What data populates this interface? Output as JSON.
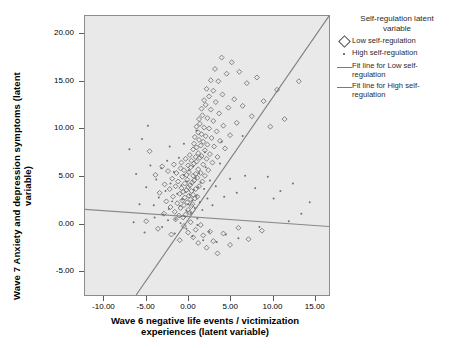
{
  "axes": {
    "y_title": "Wave 7 Anxiety and depression symptoms (latent\nvariable)",
    "x_title": "Wave 6 negative life events / victimization\nexperiences (latent variable)",
    "y_ticks": [
      "20.00",
      "15.00",
      "10.00",
      "5.00",
      "0.00",
      "-5.00"
    ],
    "x_ticks": [
      "-10.00",
      "-5.00",
      "0.00",
      "5.00",
      "10.00",
      "15.00"
    ]
  },
  "legend": {
    "title": "Self-regulation latent\nvariable",
    "items": [
      {
        "key": "diamond",
        "label": "Low self-regulation"
      },
      {
        "key": "dot",
        "label": "High self-regulation"
      },
      {
        "key": "line",
        "label": "Fit line for Low self-\nregulation"
      },
      {
        "key": "line",
        "label": "Fit line for High self-\nregulation"
      }
    ]
  },
  "colors": {
    "plot_background": "#e9e9e9",
    "frame": "#8c8c8c",
    "marker": "#6f6f6f",
    "fit_line_low": "#7c7c7c",
    "fit_line_high": "#8a8a8a",
    "text": "#000000"
  },
  "chart_data": {
    "type": "scatter",
    "title": "",
    "xlabel": "Wave 6 negative life events / victimization experiences (latent variable)",
    "ylabel": "Wave 7 Anxiety and depression symptoms (latent variable)",
    "xlim": [
      -12.3,
      16.8
    ],
    "ylim": [
      -7.6,
      21.9
    ],
    "grid": false,
    "legend_position": "right",
    "series": [
      {
        "name": "Low self-regulation",
        "marker": "open-diamond",
        "points": [
          [
            -4.6,
            7.6
          ],
          [
            -3.9,
            5.1
          ],
          [
            -3.4,
            3.2
          ],
          [
            -3.1,
            6.0
          ],
          [
            -2.8,
            4.1
          ],
          [
            -2.6,
            2.3
          ],
          [
            -2.4,
            5.5
          ],
          [
            -2.2,
            3.6
          ],
          [
            -2.1,
            1.7
          ],
          [
            -1.9,
            4.7
          ],
          [
            -1.8,
            2.8
          ],
          [
            -1.7,
            6.2
          ],
          [
            -1.6,
            1.2
          ],
          [
            -1.5,
            3.9
          ],
          [
            -1.4,
            5.3
          ],
          [
            -1.3,
            2.1
          ],
          [
            -1.2,
            4.4
          ],
          [
            -1.1,
            0.8
          ],
          [
            -1.0,
            3.1
          ],
          [
            -0.9,
            5.8
          ],
          [
            -0.9,
            1.6
          ],
          [
            -0.8,
            3.7
          ],
          [
            -0.8,
            6.4
          ],
          [
            -0.7,
            2.4
          ],
          [
            -0.7,
            4.9
          ],
          [
            -0.6,
            0.6
          ],
          [
            -0.6,
            3.3
          ],
          [
            -0.5,
            5.6
          ],
          [
            -0.5,
            1.9
          ],
          [
            -0.4,
            4.2
          ],
          [
            -0.4,
            2.7
          ],
          [
            -0.3,
            6.8
          ],
          [
            -0.3,
            0.9
          ],
          [
            -0.2,
            3.5
          ],
          [
            -0.2,
            5.1
          ],
          [
            -0.1,
            2.2
          ],
          [
            -0.1,
            4.6
          ],
          [
            0.0,
            1.4
          ],
          [
            0.0,
            3.8
          ],
          [
            0.0,
            6.1
          ],
          [
            0.1,
            2.9
          ],
          [
            0.1,
            5.4
          ],
          [
            0.2,
            1.1
          ],
          [
            0.2,
            4.0
          ],
          [
            0.2,
            7.2
          ],
          [
            0.3,
            2.5
          ],
          [
            0.3,
            5.9
          ],
          [
            0.4,
            3.4
          ],
          [
            0.4,
            1.8
          ],
          [
            0.4,
            6.6
          ],
          [
            0.5,
            4.3
          ],
          [
            0.5,
            2.0
          ],
          [
            0.6,
            7.8
          ],
          [
            0.6,
            5.0
          ],
          [
            0.6,
            3.0
          ],
          [
            0.7,
            8.4
          ],
          [
            0.7,
            6.3
          ],
          [
            0.7,
            4.5
          ],
          [
            0.8,
            2.6
          ],
          [
            0.8,
            9.1
          ],
          [
            0.9,
            7.0
          ],
          [
            0.9,
            5.2
          ],
          [
            0.9,
            3.6
          ],
          [
            1.0,
            10.2
          ],
          [
            1.0,
            8.0
          ],
          [
            1.0,
            6.5
          ],
          [
            1.1,
            4.8
          ],
          [
            1.1,
            2.8
          ],
          [
            1.2,
            9.6
          ],
          [
            1.2,
            7.4
          ],
          [
            1.2,
            5.7
          ],
          [
            1.3,
            11.0
          ],
          [
            1.3,
            8.8
          ],
          [
            1.3,
            3.9
          ],
          [
            1.4,
            6.9
          ],
          [
            1.4,
            10.5
          ],
          [
            1.5,
            8.2
          ],
          [
            1.5,
            5.3
          ],
          [
            1.6,
            12.1
          ],
          [
            1.6,
            9.4
          ],
          [
            1.6,
            7.1
          ],
          [
            1.7,
            4.4
          ],
          [
            1.7,
            11.4
          ],
          [
            1.8,
            8.6
          ],
          [
            1.8,
            6.2
          ],
          [
            1.9,
            13.0
          ],
          [
            1.9,
            10.1
          ],
          [
            2.0,
            7.7
          ],
          [
            2.0,
            5.0
          ],
          [
            2.1,
            12.5
          ],
          [
            2.1,
            9.2
          ],
          [
            2.2,
            6.8
          ],
          [
            2.2,
            14.2
          ],
          [
            2.3,
            11.1
          ],
          [
            2.3,
            8.3
          ],
          [
            2.4,
            5.6
          ],
          [
            2.5,
            13.4
          ],
          [
            2.5,
            10.0
          ],
          [
            2.6,
            7.3
          ],
          [
            2.7,
            15.1
          ],
          [
            2.7,
            12.0
          ],
          [
            2.8,
            9.0
          ],
          [
            2.9,
            6.4
          ],
          [
            3.0,
            14.0
          ],
          [
            3.0,
            10.8
          ],
          [
            3.1,
            8.1
          ],
          [
            3.2,
            16.3
          ],
          [
            3.3,
            12.8
          ],
          [
            3.4,
            9.7
          ],
          [
            3.5,
            7.0
          ],
          [
            3.6,
            15.0
          ],
          [
            3.7,
            11.6
          ],
          [
            3.8,
            8.7
          ],
          [
            4.0,
            17.5
          ],
          [
            4.1,
            13.6
          ],
          [
            4.2,
            10.3
          ],
          [
            4.4,
            7.9
          ],
          [
            4.6,
            15.8
          ],
          [
            4.8,
            12.2
          ],
          [
            5.0,
            9.3
          ],
          [
            5.2,
            17.0
          ],
          [
            5.5,
            13.1
          ],
          [
            5.8,
            10.6
          ],
          [
            6.1,
            16.0
          ],
          [
            6.5,
            12.4
          ],
          [
            7.0,
            14.8
          ],
          [
            7.6,
            11.3
          ],
          [
            8.2,
            15.4
          ],
          [
            9.0,
            12.9
          ],
          [
            9.8,
            10.2
          ],
          [
            10.6,
            14.1
          ],
          [
            11.5,
            11.0
          ],
          [
            13.2,
            15.0
          ],
          [
            -5.0,
            0.2
          ],
          [
            -3.6,
            -0.6
          ],
          [
            -2.9,
            1.0
          ],
          [
            -2.0,
            -1.2
          ],
          [
            -1.5,
            0.4
          ],
          [
            -1.0,
            -1.8
          ],
          [
            -0.5,
            -0.3
          ],
          [
            0.0,
            -1.0
          ],
          [
            0.3,
            0.1
          ],
          [
            0.6,
            -1.5
          ],
          [
            0.9,
            -0.7
          ],
          [
            1.2,
            -2.1
          ],
          [
            1.5,
            -0.2
          ],
          [
            1.8,
            -1.3
          ],
          [
            2.2,
            -2.6
          ],
          [
            2.6,
            -0.9
          ],
          [
            3.0,
            -1.9
          ],
          [
            3.5,
            -3.2
          ],
          [
            4.2,
            -1.1
          ],
          [
            5.0,
            -2.3
          ],
          [
            6.0,
            -0.5
          ],
          [
            7.2,
            -1.7
          ],
          [
            8.8,
            -0.8
          ]
        ]
      },
      {
        "name": "High self-regulation",
        "marker": "small-dot",
        "points": [
          [
            -7.0,
            7.8
          ],
          [
            -6.2,
            5.2
          ],
          [
            -5.5,
            8.9
          ],
          [
            -5.0,
            3.8
          ],
          [
            -4.5,
            6.1
          ],
          [
            -4.1,
            1.9
          ],
          [
            -3.8,
            4.6
          ],
          [
            -3.5,
            2.7
          ],
          [
            -3.2,
            5.8
          ],
          [
            -3.0,
            0.9
          ],
          [
            -2.7,
            3.4
          ],
          [
            -2.5,
            6.6
          ],
          [
            -2.3,
            1.5
          ],
          [
            -2.1,
            4.2
          ],
          [
            -1.9,
            2.3
          ],
          [
            -1.7,
            5.4
          ],
          [
            -1.5,
            0.4
          ],
          [
            -1.3,
            3.1
          ],
          [
            -1.1,
            6.9
          ],
          [
            -1.0,
            1.8
          ],
          [
            -0.8,
            4.0
          ],
          [
            -0.7,
            2.5
          ],
          [
            -0.5,
            5.1
          ],
          [
            -0.4,
            0.7
          ],
          [
            -0.3,
            3.3
          ],
          [
            -0.2,
            1.3
          ],
          [
            -0.1,
            4.4
          ],
          [
            0.0,
            2.0
          ],
          [
            0.1,
            5.6
          ],
          [
            0.2,
            3.0
          ],
          [
            0.3,
            1.1
          ],
          [
            0.4,
            4.1
          ],
          [
            0.5,
            2.4
          ],
          [
            0.6,
            6.0
          ],
          [
            0.7,
            3.5
          ],
          [
            0.8,
            1.6
          ],
          [
            0.9,
            4.8
          ],
          [
            1.0,
            2.9
          ],
          [
            1.1,
            0.5
          ],
          [
            1.2,
            3.8
          ],
          [
            1.3,
            5.3
          ],
          [
            1.4,
            2.2
          ],
          [
            1.5,
            4.3
          ],
          [
            1.7,
            1.4
          ],
          [
            1.9,
            3.6
          ],
          [
            2.1,
            5.9
          ],
          [
            2.3,
            2.6
          ],
          [
            2.6,
            4.5
          ],
          [
            2.9,
            1.9
          ],
          [
            3.3,
            3.9
          ],
          [
            3.8,
            6.3
          ],
          [
            4.3,
            2.8
          ],
          [
            5.0,
            4.7
          ],
          [
            5.8,
            3.2
          ],
          [
            6.8,
            5.0
          ],
          [
            8.0,
            3.7
          ],
          [
            9.5,
            4.9
          ],
          [
            11.0,
            3.4
          ],
          [
            12.5,
            4.2
          ],
          [
            -6.5,
            0.1
          ],
          [
            -5.2,
            -1.0
          ],
          [
            -4.0,
            0.6
          ],
          [
            -3.1,
            -0.4
          ],
          [
            -2.4,
            0.3
          ],
          [
            -1.6,
            -1.1
          ],
          [
            -0.9,
            0.0
          ],
          [
            -0.2,
            -0.6
          ],
          [
            0.5,
            -1.4
          ],
          [
            1.1,
            -0.2
          ],
          [
            1.8,
            -1.8
          ],
          [
            2.5,
            -0.9
          ],
          [
            3.4,
            -2.0
          ],
          [
            4.5,
            -1.2
          ],
          [
            6.0,
            -1.6
          ],
          [
            8.5,
            -0.4
          ],
          [
            -4.8,
            10.3
          ],
          [
            -2.2,
            8.1
          ],
          [
            -5.8,
            2.0
          ],
          [
            2.0,
            7.5
          ],
          [
            4.0,
            8.6
          ],
          [
            6.5,
            9.2
          ],
          [
            1.0,
            9.8
          ],
          [
            -0.5,
            8.4
          ],
          [
            10.2,
            2.6
          ],
          [
            13.5,
            1.0
          ],
          [
            12.0,
            0.2
          ],
          [
            14.5,
            2.2
          ]
        ]
      }
    ],
    "fit_lines": [
      {
        "name": "Fit line for Low self-regulation",
        "note": "steep positive slope, spans from bottom-left of frame to top-right corner",
        "endpoints": [
          [
            -6.2,
            -7.6
          ],
          [
            16.8,
            21.9
          ]
        ]
      },
      {
        "name": "Fit line for High self-regulation",
        "note": "shallow slightly negative slope across full width",
        "endpoints": [
          [
            -12.3,
            1.45
          ],
          [
            16.8,
            -0.35
          ]
        ]
      }
    ]
  }
}
